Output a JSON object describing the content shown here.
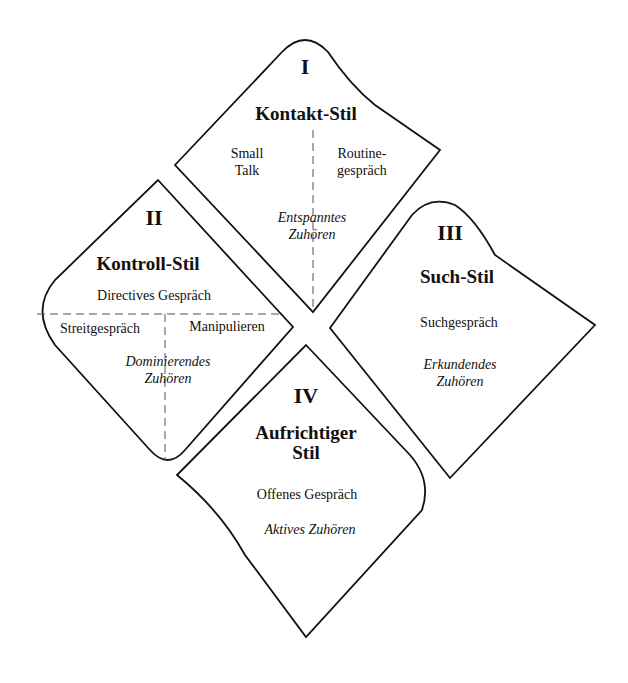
{
  "quadrants": [
    {
      "numeral": "I",
      "title": "Kontakt-Stil",
      "items": [
        "Small\nTalk",
        "Routine-\ngespräch"
      ],
      "item_left": "Small",
      "item_left_2": "Talk",
      "item_right": "Routine-",
      "item_right_2": "gespräch",
      "listening": "Entspanntes",
      "listening_2": "Zuhören"
    },
    {
      "numeral": "II",
      "title": "Kontroll-Stil",
      "top_item": "Directives Gespräch",
      "item_left": "Streitgespräch",
      "item_right": "Manipulieren",
      "listening": "Dominierendes",
      "listening_2": "Zuhören"
    },
    {
      "numeral": "III",
      "title": "Such-Stil",
      "item": "Suchgespräch",
      "listening": "Erkundendes",
      "listening_2": "Zuhören"
    },
    {
      "numeral": "IV",
      "title": "Aufrichtiger",
      "title_2": "Stil",
      "item": "Offenes Gespräch",
      "listening": "Aktives Zuhören"
    }
  ]
}
